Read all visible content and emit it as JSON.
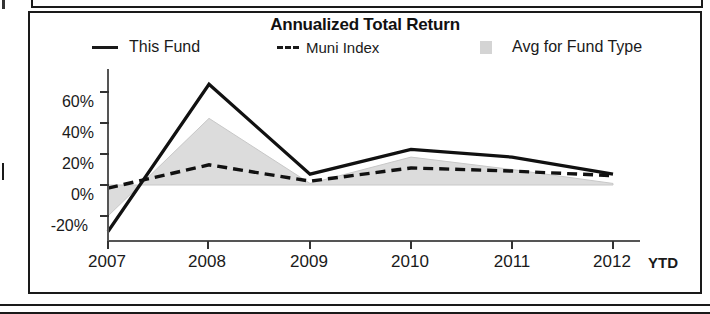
{
  "panel": {
    "title": "Annualized Total Return"
  },
  "legend": {
    "items": [
      {
        "name": "this-fund",
        "label": "This Fund",
        "marker": "solid-line",
        "color": "#1a1a1a"
      },
      {
        "name": "muni-index",
        "label": "Muni Index",
        "marker": "dashed-line",
        "color": "#1a1a1a"
      },
      {
        "name": "avg-for-fund-type",
        "label": "Avg for Fund Type",
        "marker": "filled-square",
        "color": "#d4d4d4"
      }
    ]
  },
  "axis": {
    "y_ticks": [
      "60%",
      "40%",
      "20%",
      "0%",
      "-20%"
    ],
    "x_ticks": [
      "2007",
      "2008",
      "2009",
      "2010",
      "2011",
      "2012"
    ],
    "x_suffix": "YTD"
  },
  "chart_data": {
    "type": "line",
    "title": "Annualized Total Return",
    "xlabel": "",
    "ylabel": "",
    "categories": [
      "2007",
      "2008",
      "2009",
      "2010",
      "2011",
      "2012"
    ],
    "x_suffix_label": "YTD",
    "ylim": [
      -32,
      70
    ],
    "ytick_values": [
      60,
      40,
      20,
      0,
      -20
    ],
    "ytick_labels": [
      "60%",
      "40%",
      "20%",
      "0%",
      "-20%"
    ],
    "grid": false,
    "legend_position": "top",
    "series": [
      {
        "name": "This Fund",
        "style": "solid",
        "color": "#1a1a1a",
        "values": [
          -30,
          65,
          7,
          23,
          18,
          7
        ]
      },
      {
        "name": "Muni Index",
        "style": "dashed",
        "color": "#1a1a1a",
        "values": [
          -2,
          13,
          2.5,
          11,
          9,
          6
        ]
      },
      {
        "name": "Avg for Fund Type",
        "style": "area",
        "color": "#d4d4d4",
        "values": [
          -20,
          43,
          1,
          18,
          10,
          1
        ]
      }
    ]
  }
}
